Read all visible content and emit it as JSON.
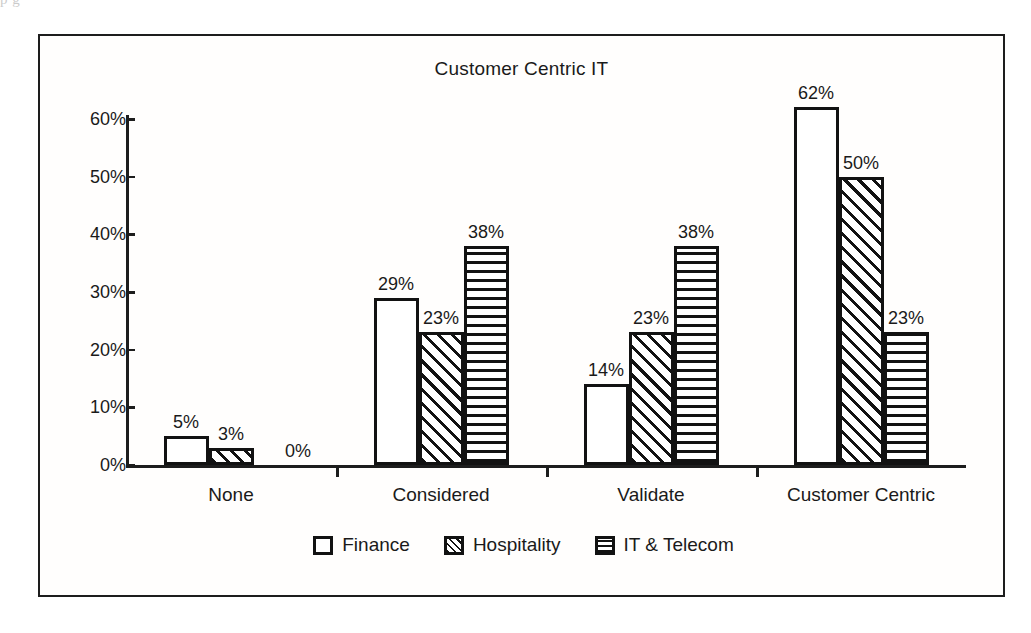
{
  "page": {
    "scan_artifact_text": "p                                                                                                                                                                                  g"
  },
  "chart_data": {
    "type": "bar",
    "title": "Customer Centric IT",
    "xlabel": "",
    "ylabel": "",
    "ylim": [
      0,
      60
    ],
    "ytick_labels": [
      "0%",
      "10%",
      "20%",
      "30%",
      "40%",
      "50%",
      "60%"
    ],
    "ytick_values": [
      0,
      10,
      20,
      30,
      40,
      50,
      60
    ],
    "grid": false,
    "legend_position": "bottom",
    "categories": [
      "None",
      "Considered",
      "Validate",
      "Customer Centric"
    ],
    "series": [
      {
        "name": "Finance",
        "pattern": "solid-white",
        "values": [
          5,
          29,
          14,
          62
        ],
        "labels": [
          "5%",
          "29%",
          "14%",
          "62%"
        ]
      },
      {
        "name": "Hospitality",
        "pattern": "diagonal-hatch",
        "values": [
          3,
          23,
          23,
          50
        ],
        "labels": [
          "3%",
          "23%",
          "23%",
          "50%"
        ]
      },
      {
        "name": "IT & Telecom",
        "pattern": "horizontal-lines",
        "values": [
          0,
          38,
          38,
          23
        ],
        "labels": [
          "0%",
          "38%",
          "38%",
          "23%"
        ]
      }
    ]
  },
  "colors": {
    "ink": "#121212",
    "paper": "#ffffff",
    "frame": "#1d1d1d"
  }
}
